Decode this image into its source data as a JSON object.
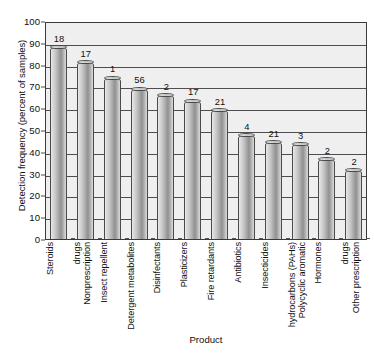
{
  "chart_data": {
    "type": "bar",
    "title": "",
    "xlabel": "Product",
    "ylabel": "Detection frequency (percent of samples)",
    "ylim": [
      0,
      100
    ],
    "ytick_step": 10,
    "yticks": [
      "100",
      "90",
      "80",
      "70",
      "60",
      "50",
      "40",
      "30",
      "20",
      "10",
      "0"
    ],
    "grid": "horizontal",
    "legend": "none",
    "categories": [
      "Steroids",
      "Nonprescription drugs",
      "Insect repellent",
      "Detergent metabolites",
      "Disinfectants",
      "Plasticizers",
      "Fire retardants",
      "Antibiotics",
      "Insecticides",
      "Polycyclic aromatic hydrocarbons (PAHs)",
      "Hormones",
      "Other prescription drugs"
    ],
    "category_lines": [
      [
        "Steroids"
      ],
      [
        "Nonprescription",
        "drugs"
      ],
      [
        "Insect repellent"
      ],
      [
        "Detergent metabolites"
      ],
      [
        "Disinfectants"
      ],
      [
        "Plasticizers"
      ],
      [
        "Fire retardants"
      ],
      [
        "Antibiotics"
      ],
      [
        "Insecticides"
      ],
      [
        "Polycyclic aromatic",
        "hydrocarbons (PAHs)"
      ],
      [
        "Hormones"
      ],
      [
        "Other prescription",
        "drugs"
      ]
    ],
    "values": [
      88,
      81,
      74,
      69,
      66,
      63.5,
      59,
      47.5,
      44.5,
      43.5,
      36.5,
      31.5
    ],
    "bar_labels": [
      "18",
      "17",
      "1",
      "56",
      "2",
      "17",
      "21",
      "4",
      "21",
      "3",
      "2",
      "2"
    ],
    "colors": {
      "plot_background": "#efefef",
      "gridline": "#4e4e4e",
      "axis": "#3a3a3a",
      "bar_light": "#e9e9e9",
      "bar_dark": "#909090",
      "text": "#111111"
    }
  }
}
